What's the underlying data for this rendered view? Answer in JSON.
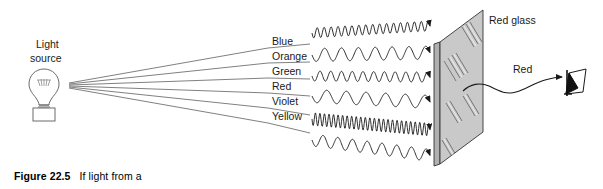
{
  "figure": {
    "caption_number": "Figure 22.5",
    "caption_text": "If light from a",
    "source_label_line1": "Light",
    "source_label_line2": "source",
    "glass_label": "Red glass",
    "transmitted_label": "Red"
  },
  "rays": [
    {
      "name": "Blue",
      "label": "Blue",
      "label_x": 272,
      "label_y": 45,
      "line_y": 48,
      "wave_y": 33,
      "cycles": 17,
      "amplitude": 5.0
    },
    {
      "name": "Orange",
      "label": "Orange",
      "label_x": 272,
      "label_y": 60,
      "line_y": 63,
      "wave_y": 55,
      "cycles": 7,
      "amplitude": 6.5
    },
    {
      "name": "Green",
      "label": "Green",
      "label_x": 272,
      "label_y": 75,
      "line_y": 78,
      "wave_y": 76,
      "cycles": 11,
      "amplitude": 5.0
    },
    {
      "name": "Red",
      "label": "Red",
      "label_x": 272,
      "label_y": 90,
      "line_y": 93,
      "wave_y": 96,
      "cycles": 6,
      "amplitude": 6.5
    },
    {
      "name": "Violet",
      "label": "Violet",
      "label_x": 272,
      "label_y": 105,
      "line_y": 108,
      "wave_y": 119,
      "cycles": 26,
      "amplitude": 6.5
    },
    {
      "name": "Yellow",
      "label": "Yellow",
      "label_x": 272,
      "label_y": 120,
      "line_y": 123,
      "wave_y": 140,
      "cycles": 8,
      "amplitude": 6.0
    }
  ],
  "colors": {
    "line": "#555555",
    "wave": "#1a1a1a",
    "glass_fill": "#c9c9c9",
    "glass_edge": "#9a9a9a",
    "glass_stroke": "#333333",
    "text": "#1a1a1a",
    "background": "#ffffff"
  },
  "geometry": {
    "source_x": 69,
    "source_y": 86,
    "panel_top_right_x": 483,
    "panel_top_right_y": 10,
    "panel_top_left_x": 440,
    "panel_top_left_y": 42,
    "panel_bottom_left_x": 440,
    "panel_bottom_left_y": 164,
    "panel_bottom_right_x": 483,
    "panel_bottom_right_y": 132
  },
  "icons": {
    "bulb": "light-bulb-icon",
    "eye": "observer-eye-icon",
    "glass": "glass-panel-icon"
  }
}
